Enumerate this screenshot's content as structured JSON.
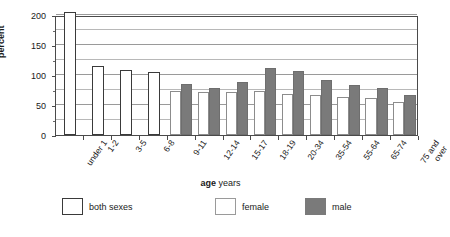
{
  "chart_data": {
    "type": "bar",
    "title": "",
    "xlabel_bold": "age",
    "xlabel_rest": "years",
    "ylabel": "percent",
    "ylim": [
      0,
      200
    ],
    "yticks": [
      0,
      50,
      100,
      150,
      200
    ],
    "ytick_labels": [
      "0",
      "50",
      "100",
      "150",
      "200"
    ],
    "yminor_step": 25,
    "grid": true,
    "legend_position": "bottom",
    "categories": [
      "under 1",
      "1-2",
      "3-5",
      "6-8",
      "9-11",
      "12-14",
      "15-17",
      "18-19",
      "20-34",
      "35-54",
      "55-64",
      "65-74",
      "75 and over"
    ],
    "series": [
      {
        "name": "both sexes",
        "color": "#ffffff",
        "border": "#3a3a3a",
        "values": [
          205,
          115,
          108,
          105,
          null,
          null,
          null,
          null,
          null,
          null,
          null,
          null,
          null
        ]
      },
      {
        "name": "female",
        "color": "#ffffff",
        "border": "#8c8c8c",
        "values": [
          null,
          null,
          null,
          null,
          74,
          71,
          72,
          73,
          69,
          67,
          63,
          61,
          55
        ]
      },
      {
        "name": "male",
        "color": "#7a7a7a",
        "border": "#6e6e6e",
        "values": [
          null,
          null,
          null,
          null,
          85,
          79,
          89,
          111,
          106,
          92,
          84,
          78,
          67
        ]
      }
    ]
  },
  "legend": {
    "items": [
      {
        "label": "both sexes",
        "kind": "both"
      },
      {
        "label": "female",
        "kind": "female"
      },
      {
        "label": "male",
        "kind": "male"
      }
    ]
  }
}
